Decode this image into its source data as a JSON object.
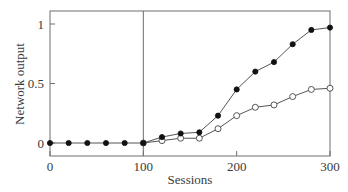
{
  "chart_data": {
    "type": "line",
    "title": "",
    "xlabel": "Sessions",
    "ylabel": "Network output",
    "xlim": [
      0,
      300
    ],
    "ylim": [
      -0.08,
      1.1
    ],
    "xticks": [
      0,
      100,
      200,
      300
    ],
    "xtick_labels": [
      "0",
      "100",
      "200",
      "300"
    ],
    "yticks": [
      0,
      0.5,
      1
    ],
    "ytick_labels": [
      "0",
      "0.5",
      "1"
    ],
    "grid": false,
    "legend": null,
    "annotations": [
      {
        "type": "vertical-line",
        "x": 100
      }
    ],
    "x": [
      0,
      20,
      40,
      60,
      80,
      100,
      120,
      140,
      160,
      180,
      200,
      220,
      240,
      260,
      280,
      300
    ],
    "series": [
      {
        "name": "filled-markers",
        "marker": "filled-circle",
        "values": [
          0,
          0,
          0,
          0,
          0,
          0,
          0.05,
          0.08,
          0.09,
          0.23,
          0.45,
          0.6,
          0.68,
          0.83,
          0.95,
          0.97
        ]
      },
      {
        "name": "open-markers",
        "marker": "open-circle",
        "values": [
          null,
          null,
          null,
          null,
          null,
          0,
          0.02,
          0.04,
          0.04,
          0.12,
          0.23,
          0.3,
          0.32,
          0.39,
          0.45,
          0.46
        ]
      }
    ]
  }
}
